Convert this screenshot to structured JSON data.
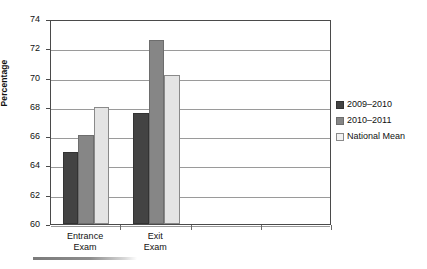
{
  "chart_data": {
    "type": "bar",
    "title": "",
    "xlabel": "",
    "ylabel": "Percentage",
    "ylim": [
      60,
      74
    ],
    "ytick_step": 2,
    "yticks": [
      60,
      62,
      64,
      66,
      68,
      70,
      72,
      74
    ],
    "ytick_labels": [
      "60",
      "62",
      "64",
      "66",
      "68",
      "70",
      "72",
      "74"
    ],
    "grid": true,
    "grid_axis": "y",
    "legend_position": "right",
    "categories": [
      "Entrance Exam",
      "Exit Exam"
    ],
    "category_lines": [
      [
        "Entrance",
        "Exam"
      ],
      [
        "Exit",
        "Exam"
      ]
    ],
    "x_tick_count": 4,
    "series": [
      {
        "name": "2009–2010",
        "color": "#434343",
        "values": [
          64.95,
          67.6
        ]
      },
      {
        "name": "2010–2011",
        "color": "#868686",
        "values": [
          66.1,
          72.6
        ]
      },
      {
        "name": "National Mean",
        "color": "#e4e4e4",
        "values": [
          68.0,
          70.2
        ]
      }
    ]
  },
  "axis": {
    "y_title": "Percentage"
  },
  "legend": {
    "items": [
      {
        "label": "2009–2010"
      },
      {
        "label": "2010–2011"
      },
      {
        "label": "National Mean"
      }
    ]
  }
}
